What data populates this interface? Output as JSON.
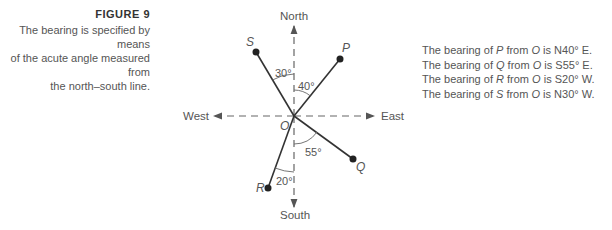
{
  "caption": {
    "figure_label": "FIGURE 9",
    "lines": [
      "The bearing is specified by means",
      "of the acute angle measured from",
      "the north–south line."
    ]
  },
  "directions": {
    "north": "North",
    "south": "South",
    "east": "East",
    "west": "West"
  },
  "origin_label": "O",
  "points": {
    "P": {
      "label": "P",
      "angle": "40°"
    },
    "Q": {
      "label": "Q",
      "angle": "55°"
    },
    "R": {
      "label": "R",
      "angle": "20°"
    },
    "S": {
      "label": "S",
      "angle": "30°"
    }
  },
  "bearings": [
    {
      "prefix": "The bearing of ",
      "point": "P",
      "mid": " from ",
      "origin": "O",
      "suffix": " is N40° E."
    },
    {
      "prefix": "The bearing of ",
      "point": "Q",
      "mid": " from ",
      "origin": "O",
      "suffix": " is S55° E."
    },
    {
      "prefix": "The bearing of ",
      "point": "R",
      "mid": " from ",
      "origin": "O",
      "suffix": " is S20° W."
    },
    {
      "prefix": "The bearing of ",
      "point": "S",
      "mid": " from ",
      "origin": "O",
      "suffix": " is N30° W."
    }
  ],
  "colors": {
    "line": "#333333",
    "dash": "#666666",
    "text": "#555555"
  }
}
